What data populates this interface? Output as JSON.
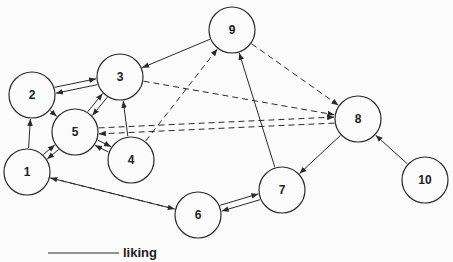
{
  "diagram": {
    "type": "directed-graph",
    "node_radius": 23,
    "colors": {
      "stroke": "#2a2a2a",
      "background": "#fbfbfb",
      "text": "#222222"
    },
    "nodes": [
      {
        "id": "1",
        "label": "1",
        "x": 27,
        "y": 172
      },
      {
        "id": "2",
        "label": "2",
        "x": 32,
        "y": 95
      },
      {
        "id": "3",
        "label": "3",
        "x": 120,
        "y": 77
      },
      {
        "id": "4",
        "label": "4",
        "x": 131,
        "y": 160
      },
      {
        "id": "5",
        "label": "5",
        "x": 75,
        "y": 132
      },
      {
        "id": "6",
        "label": "6",
        "x": 198,
        "y": 215
      },
      {
        "id": "7",
        "label": "7",
        "x": 282,
        "y": 190
      },
      {
        "id": "8",
        "label": "8",
        "x": 358,
        "y": 119
      },
      {
        "id": "9",
        "label": "9",
        "x": 232,
        "y": 30
      },
      {
        "id": "10",
        "label": "10",
        "x": 425,
        "y": 180
      }
    ],
    "edges": [
      {
        "from": "9",
        "to": "3",
        "style": "solid"
      },
      {
        "from": "9",
        "to": "8",
        "style": "dashed"
      },
      {
        "from": "2",
        "to": "3",
        "style": "solid",
        "offset": -3
      },
      {
        "from": "3",
        "to": "2",
        "style": "solid",
        "offset": -3
      },
      {
        "from": "3",
        "to": "5",
        "style": "solid",
        "offset": -3
      },
      {
        "from": "5",
        "to": "3",
        "style": "solid",
        "offset": -3
      },
      {
        "from": "3",
        "to": "8",
        "style": "dashed"
      },
      {
        "from": "2",
        "to": "5",
        "style": "solid"
      },
      {
        "from": "1",
        "to": "2",
        "style": "solid"
      },
      {
        "from": "1",
        "to": "5",
        "style": "solid",
        "offset": -3
      },
      {
        "from": "5",
        "to": "1",
        "style": "solid",
        "offset": -3
      },
      {
        "from": "4",
        "to": "3",
        "style": "solid"
      },
      {
        "from": "4",
        "to": "9",
        "style": "dashed"
      },
      {
        "from": "4",
        "to": "5",
        "style": "solid",
        "offset": -3
      },
      {
        "from": "5",
        "to": "4",
        "style": "solid",
        "offset": -3
      },
      {
        "from": "8",
        "to": "5",
        "style": "dashed",
        "offset": -3
      },
      {
        "from": "5",
        "to": "8",
        "style": "dashed",
        "offset": -3
      },
      {
        "from": "6",
        "to": "1",
        "style": "solid"
      },
      {
        "from": "1",
        "to": "6",
        "style": "dashed"
      },
      {
        "from": "6",
        "to": "7",
        "style": "solid",
        "offset": -3
      },
      {
        "from": "7",
        "to": "6",
        "style": "solid",
        "offset": -3
      },
      {
        "from": "7",
        "to": "9",
        "style": "solid"
      },
      {
        "from": "8",
        "to": "7",
        "style": "solid"
      },
      {
        "from": "10",
        "to": "8",
        "style": "solid"
      }
    ],
    "legend": [
      {
        "style": "solid",
        "label": "liking",
        "x1": 48,
        "x2": 119,
        "y": 253
      }
    ]
  }
}
